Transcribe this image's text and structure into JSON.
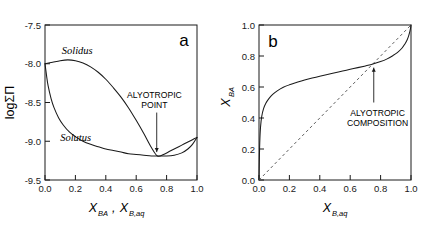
{
  "figure": {
    "background": "#ffffff",
    "curve_color": "#1a1a1a",
    "diagonal_color": "#666666"
  },
  "chart_data": [
    {
      "type": "line",
      "panel_label": "a",
      "title": "",
      "xlabel": "X_BA, X_B,aq",
      "xlabel_parts": [
        {
          "base": "X",
          "sub": "BA",
          "trail": ","
        },
        {
          "base": "X",
          "sub": "B,aq",
          "trail": ""
        }
      ],
      "ylabel": "logΣΠ",
      "xlim": [
        0.0,
        1.0
      ],
      "ylim": [
        -9.5,
        -7.5
      ],
      "xticks": [
        "0.0",
        "0.2",
        "0.4",
        "0.6",
        "0.8",
        "1.0"
      ],
      "xtick_values": [
        0.0,
        0.2,
        0.4,
        0.6,
        0.8,
        1.0
      ],
      "yticks": [
        "-7.5",
        "-8.0",
        "-8.5",
        "-9.0",
        "-9.5"
      ],
      "ytick_values": [
        -7.5,
        -8.0,
        -8.5,
        -9.0,
        -9.5
      ],
      "grid": false,
      "legend": "none",
      "series": [
        {
          "name": "Solidus",
          "label_text": "Solidus",
          "label_x": 0.11,
          "label_y": -7.87,
          "points": [
            [
              0.0,
              -8.0
            ],
            [
              0.05,
              -7.98
            ],
            [
              0.1,
              -7.96
            ],
            [
              0.15,
              -7.95
            ],
            [
              0.2,
              -7.96
            ],
            [
              0.25,
              -7.99
            ],
            [
              0.3,
              -8.04
            ],
            [
              0.35,
              -8.11
            ],
            [
              0.4,
              -8.2
            ],
            [
              0.45,
              -8.31
            ],
            [
              0.5,
              -8.43
            ],
            [
              0.55,
              -8.57
            ],
            [
              0.6,
              -8.73
            ],
            [
              0.65,
              -8.9
            ],
            [
              0.7,
              -9.08
            ],
            [
              0.74,
              -9.19
            ],
            [
              0.78,
              -9.17
            ],
            [
              0.82,
              -9.13
            ],
            [
              0.86,
              -9.09
            ],
            [
              0.9,
              -9.05
            ],
            [
              0.94,
              -9.01
            ],
            [
              0.97,
              -8.98
            ],
            [
              1.0,
              -8.95
            ]
          ]
        },
        {
          "name": "Solutus",
          "label_text": "Solutus",
          "label_x": 0.1,
          "label_y": -9.0,
          "points": [
            [
              0.0,
              -8.0
            ],
            [
              0.01,
              -8.15
            ],
            [
              0.02,
              -8.28
            ],
            [
              0.04,
              -8.45
            ],
            [
              0.06,
              -8.57
            ],
            [
              0.09,
              -8.7
            ],
            [
              0.12,
              -8.79
            ],
            [
              0.16,
              -8.88
            ],
            [
              0.2,
              -8.94
            ],
            [
              0.25,
              -9.0
            ],
            [
              0.3,
              -9.04
            ],
            [
              0.35,
              -9.07
            ],
            [
              0.4,
              -9.1
            ],
            [
              0.45,
              -9.12
            ],
            [
              0.5,
              -9.14
            ],
            [
              0.55,
              -9.16
            ],
            [
              0.6,
              -9.17
            ],
            [
              0.65,
              -9.18
            ],
            [
              0.7,
              -9.19
            ],
            [
              0.74,
              -9.19
            ],
            [
              0.8,
              -9.19
            ],
            [
              0.85,
              -9.18
            ],
            [
              0.9,
              -9.15
            ],
            [
              0.94,
              -9.1
            ],
            [
              0.97,
              -9.04
            ],
            [
              1.0,
              -8.95
            ]
          ]
        }
      ],
      "annotations": [
        {
          "text_line1": "ALYOTROPIC",
          "text_line2": "POINT",
          "text_x": 0.72,
          "text_y": -8.44,
          "arrow_from_x": 0.735,
          "arrow_from_y": -8.63,
          "arrow_to_x": 0.735,
          "arrow_to_y": -9.14
        }
      ]
    },
    {
      "type": "line",
      "panel_label": "b",
      "title": "",
      "xlabel": "X_B,aq",
      "xlabel_parts": [
        {
          "base": "X",
          "sub": "B,aq",
          "trail": ""
        }
      ],
      "ylabel": "X_BA",
      "ylabel_base": "X",
      "ylabel_sub": "BA",
      "xlim": [
        0.0,
        1.0
      ],
      "ylim": [
        0.0,
        1.0
      ],
      "xticks": [
        "0.0",
        "0.2",
        "0.4",
        "0.6",
        "0.8",
        "1.0"
      ],
      "xtick_values": [
        0.0,
        0.2,
        0.4,
        0.6,
        0.8,
        1.0
      ],
      "yticks": [
        "0.0",
        "0.2",
        "0.4",
        "0.6",
        "0.8",
        "1.0"
      ],
      "ytick_values": [
        0.0,
        0.2,
        0.4,
        0.6,
        0.8,
        1.0
      ],
      "grid": false,
      "legend": "none",
      "series": [
        {
          "name": "distribution-curve",
          "points": [
            [
              0.0,
              0.0
            ],
            [
              0.002,
              0.12
            ],
            [
              0.005,
              0.24
            ],
            [
              0.01,
              0.34
            ],
            [
              0.018,
              0.41
            ],
            [
              0.03,
              0.46
            ],
            [
              0.045,
              0.495
            ],
            [
              0.065,
              0.525
            ],
            [
              0.09,
              0.552
            ],
            [
              0.12,
              0.575
            ],
            [
              0.16,
              0.598
            ],
            [
              0.2,
              0.614
            ],
            [
              0.25,
              0.63
            ],
            [
              0.3,
              0.645
            ],
            [
              0.35,
              0.658
            ],
            [
              0.4,
              0.67
            ],
            [
              0.45,
              0.681
            ],
            [
              0.5,
              0.692
            ],
            [
              0.55,
              0.703
            ],
            [
              0.6,
              0.714
            ],
            [
              0.65,
              0.725
            ],
            [
              0.7,
              0.736
            ],
            [
              0.75,
              0.748
            ],
            [
              0.8,
              0.764
            ],
            [
              0.84,
              0.78
            ],
            [
              0.88,
              0.802
            ],
            [
              0.91,
              0.822
            ],
            [
              0.94,
              0.85
            ],
            [
              0.96,
              0.878
            ],
            [
              0.975,
              0.905
            ],
            [
              0.985,
              0.932
            ],
            [
              0.993,
              0.96
            ],
            [
              0.998,
              0.985
            ],
            [
              1.0,
              1.0
            ]
          ]
        },
        {
          "name": "one-to-one-diagonal",
          "style": "dashed",
          "points": [
            [
              0.0,
              0.0
            ],
            [
              1.0,
              1.0
            ]
          ]
        }
      ],
      "annotations": [
        {
          "text_line1": "ALYOTROPIC",
          "text_line2": "COMPOSITION",
          "text_x": 0.78,
          "text_y": 0.415,
          "arrow_from_x": 0.755,
          "arrow_from_y": 0.5,
          "arrow_to_x": 0.755,
          "arrow_to_y": 0.725
        }
      ]
    }
  ]
}
